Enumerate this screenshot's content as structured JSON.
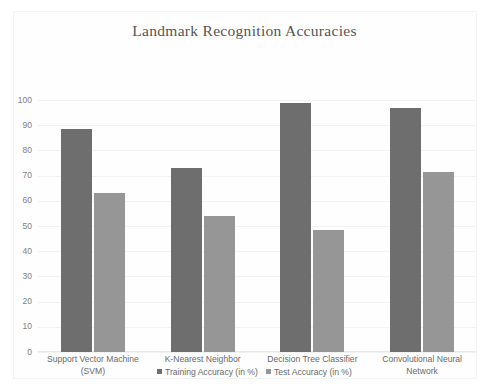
{
  "chart_data": {
    "type": "bar",
    "title": "Landmark Recognition Accuracies",
    "xlabel": "",
    "ylabel": "",
    "ylim": [
      0,
      100
    ],
    "yticks": [
      0,
      10,
      20,
      30,
      40,
      50,
      60,
      70,
      80,
      90,
      100
    ],
    "ytick_labels": [
      "0",
      "10",
      "20",
      "30",
      "40",
      "50",
      "60",
      "70",
      "80",
      "90",
      "100"
    ],
    "grid": true,
    "legend_position": "bottom",
    "categories": [
      "Support Vector Machine (SVM)",
      "K-Nearest Neighbor",
      "Decision Tree Classifier",
      "Convolutional Neural Network"
    ],
    "category_lines": [
      [
        "Support Vector Machine",
        "(SVM)"
      ],
      [
        "K-Nearest Neighbor"
      ],
      [
        "Decision Tree Classifier"
      ],
      [
        "Convolutional Neural",
        "Network"
      ]
    ],
    "series": [
      {
        "name": "Training Accuracy (in %)",
        "color": "#6e6e6e",
        "values": [
          88.5,
          73,
          99,
          97
        ]
      },
      {
        "name": "Test Accuracy (in %)",
        "color": "#969696",
        "values": [
          63,
          54,
          48.5,
          71.5
        ]
      }
    ]
  },
  "legend": {
    "training_label": "Training Accuracy (in %)",
    "test_label": "Test Accuracy (in %)"
  },
  "colors": {
    "training": "#6e6e6e",
    "test": "#969696",
    "title_text": "#555555",
    "axis_text": "#808080",
    "gridline": "#f2f2f2",
    "background": "#ffffff"
  }
}
